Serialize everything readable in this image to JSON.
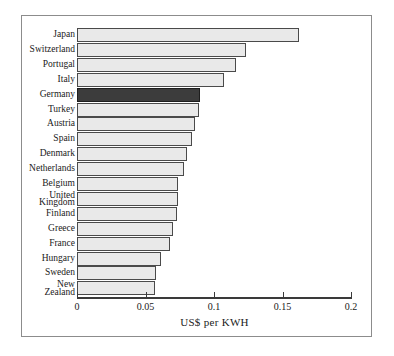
{
  "chart_data": {
    "type": "bar",
    "orientation": "horizontal",
    "title": "",
    "xlabel": "US$ per KWH",
    "ylabel": "",
    "xlim": [
      0,
      0.2
    ],
    "xticks": [
      0,
      0.05,
      0.1,
      0.15,
      0.2
    ],
    "xtick_labels": [
      "0",
      "0.05",
      "0.1",
      "0.15",
      "0.2"
    ],
    "grid": false,
    "legend": false,
    "categories": [
      "Japan",
      "Switzerland",
      "Portugal",
      "Italy",
      "Germany",
      "Turkey",
      "Austria",
      "Spain",
      "Denmark",
      "Netherlands",
      "Belgium",
      "United\nKingdom",
      "Finland",
      "Greece",
      "France",
      "Hungary",
      "Sweden",
      "New\nZealand"
    ],
    "values": [
      0.162,
      0.123,
      0.116,
      0.107,
      0.09,
      0.089,
      0.086,
      0.084,
      0.08,
      0.078,
      0.074,
      0.074,
      0.073,
      0.07,
      0.068,
      0.061,
      0.058,
      0.057
    ],
    "highlight_category": "Germany",
    "colors": {
      "bar_fill": "#e9e9e9",
      "bar_edge": "#4a4a4a",
      "highlight_fill": "#3c3c3c",
      "highlight_edge": "#1d1d1d",
      "axis": "#3a3a3a",
      "text": "#1a1a1a",
      "frame": "#8c8c8c",
      "background": "#ffffff"
    }
  }
}
